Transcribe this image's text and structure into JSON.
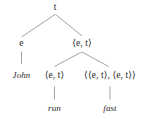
{
  "diagram": {
    "kind": "semantic-type-tree",
    "colors": {
      "background": "#ffffff",
      "text": "#2b2b2b",
      "line": "#8a8a8a"
    },
    "nodes": {
      "root_type": "t",
      "subject_type": "e",
      "predicate_type": "⟨e, t⟩",
      "verb_type": "⟨e, t⟩",
      "modifier_type": "⟨⟨e, t⟩, ⟨e, t⟩⟩",
      "subject_word": "John",
      "verb_word": "run",
      "modifier_word": "fast"
    }
  }
}
